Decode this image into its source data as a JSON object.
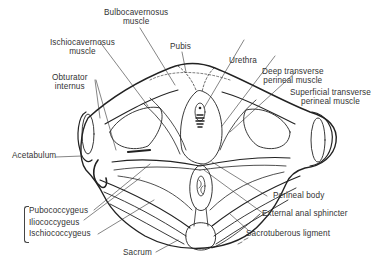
{
  "diagram": {
    "line_color": "#222222",
    "label_color": "#333333",
    "labels": {
      "bulbocavernosus": [
        "Bulbocavernosus",
        "muscle"
      ],
      "ischiocavernosus": [
        "Ischiocavernosus",
        "muscle"
      ],
      "pubis": "Pubis",
      "urethra": "Urethra",
      "obturator": [
        "Obturator",
        "internus"
      ],
      "deep_transverse": [
        "Deep transverse",
        "perineal muscle"
      ],
      "superficial_transverse": [
        "Superficial transverse",
        "perineal muscle"
      ],
      "acetabulum": "Acetabulum",
      "perineal_body": "Perineal body",
      "external_anal_sphincter": "External anal sphincter",
      "sacrotuberous": "Sacrotuberous ligment",
      "levator_group": [
        "Pubococcygeus",
        "Iliococcygeus",
        "Ischiococcygeus"
      ],
      "sacrum": "Sacrum"
    }
  }
}
